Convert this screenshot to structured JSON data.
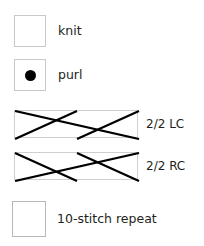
{
  "legend": {
    "title": "Knitting Chart Legend",
    "rows": [
      {
        "key": "knit",
        "symbol": "empty-square",
        "label": "knit"
      },
      {
        "key": "purl",
        "symbol": "filled-dot-square",
        "label": "purl"
      },
      {
        "key": "lc",
        "symbol": "cable-cross-left",
        "label": "2/2 LC"
      },
      {
        "key": "rc",
        "symbol": "cable-cross-right",
        "label": "2/2 RC"
      },
      {
        "key": "repeat",
        "symbol": "empty-square",
        "label": "10-stitch repeat"
      }
    ]
  },
  "colors": {
    "background": "#ffffff",
    "text": "#231f20",
    "cell_border": "#c9c9c9",
    "cable_line": "#000000",
    "purl_dot": "#000000"
  }
}
